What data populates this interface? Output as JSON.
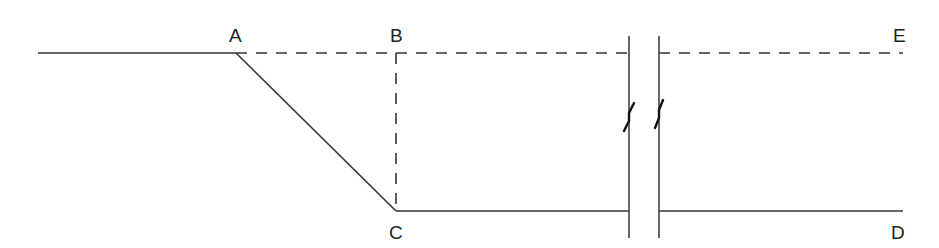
{
  "diagram": {
    "type": "geometric-profile",
    "labels": {
      "A": "A",
      "B": "B",
      "C": "C",
      "D": "D",
      "E": "E"
    },
    "points": {
      "start": [
        38,
        53
      ],
      "A": [
        236,
        53
      ],
      "B": [
        396,
        53
      ],
      "C": [
        396,
        211
      ],
      "D": [
        903,
        211
      ],
      "E": [
        903,
        53
      ]
    },
    "segments": [
      {
        "from": "start",
        "to": "A",
        "style": "solid"
      },
      {
        "from": "A",
        "to": "E",
        "style": "dashed",
        "broken_at_gap": true
      },
      {
        "from": "A",
        "to": "C",
        "style": "solid"
      },
      {
        "from": "B",
        "to": "C",
        "style": "dashed"
      },
      {
        "from": "C",
        "to": "D",
        "style": "solid",
        "broken_at_gap": true
      }
    ],
    "break_marks": {
      "left_x": 629,
      "right_x": 659,
      "y_top": 36,
      "y_bottom": 238
    },
    "colors": {
      "line": "#333333",
      "background": "#ffffff"
    }
  }
}
